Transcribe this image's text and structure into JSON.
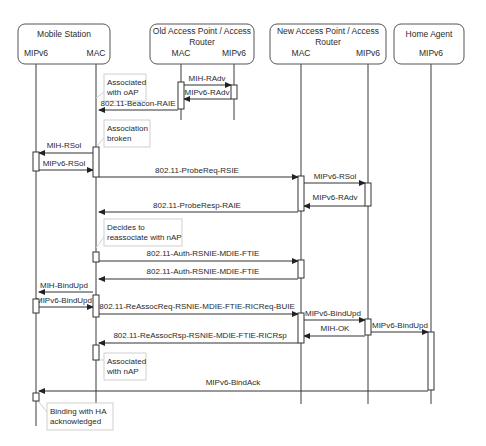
{
  "participants": [
    {
      "id": "ms",
      "title_lines": [
        "Mobile Station"
      ],
      "box": {
        "x": 18,
        "y": 24,
        "w": 92,
        "h": 40
      },
      "title_y": [
        37
      ],
      "sub": [
        {
          "label": "MIPv6",
          "x": 36
        },
        {
          "label": "MAC",
          "x": 96
        }
      ]
    },
    {
      "id": "oap",
      "title_lines": [
        "Old Access Point / Access",
        "Router"
      ],
      "box": {
        "x": 150,
        "y": 24,
        "w": 104,
        "h": 40
      },
      "title_y": [
        34,
        45
      ],
      "sub": [
        {
          "label": "MAC",
          "x": 181
        },
        {
          "label": "MIPv6",
          "x": 234
        }
      ]
    },
    {
      "id": "nap",
      "title_lines": [
        "New Access Point / Access",
        "Router"
      ],
      "box": {
        "x": 270,
        "y": 24,
        "w": 116,
        "h": 40
      },
      "title_y": [
        34,
        45
      ],
      "sub": [
        {
          "label": "MAC",
          "x": 301
        },
        {
          "label": "MIPv6",
          "x": 368
        }
      ]
    },
    {
      "id": "ha",
      "title_lines": [
        "Home Agent"
      ],
      "box": {
        "x": 394,
        "y": 24,
        "w": 70,
        "h": 40
      },
      "title_y": [
        37
      ],
      "sub": [
        {
          "label": "MIPv6",
          "x": 431
        }
      ]
    }
  ],
  "lifelines": [
    {
      "name": "ms-mipv6",
      "x": 36,
      "y1": 64,
      "y2": 426
    },
    {
      "name": "ms-mac",
      "x": 96,
      "y1": 64,
      "y2": 404
    },
    {
      "name": "oap-mac",
      "x": 181,
      "y1": 64,
      "y2": 120
    },
    {
      "name": "oap-mipv6",
      "x": 234,
      "y1": 64,
      "y2": 120
    },
    {
      "name": "nap-mac",
      "x": 301,
      "y1": 64,
      "y2": 404
    },
    {
      "name": "nap-mipv6",
      "x": 368,
      "y1": 64,
      "y2": 404
    },
    {
      "name": "ha-mipv6",
      "x": 431,
      "y1": 64,
      "y2": 404
    }
  ],
  "activations": [
    {
      "x": 178,
      "y": 82,
      "w": 6,
      "h": 27
    },
    {
      "x": 231,
      "y": 85,
      "w": 6,
      "h": 14
    },
    {
      "x": 33,
      "y": 152,
      "w": 6,
      "h": 19
    },
    {
      "x": 93,
      "y": 147,
      "w": 6,
      "h": 30
    },
    {
      "x": 298,
      "y": 176,
      "w": 6,
      "h": 35
    },
    {
      "x": 365,
      "y": 183,
      "w": 6,
      "h": 23
    },
    {
      "x": 93,
      "y": 252,
      "w": 6,
      "h": 10
    },
    {
      "x": 298,
      "y": 260,
      "w": 6,
      "h": 18
    },
    {
      "x": 33,
      "y": 299,
      "w": 6,
      "h": 14
    },
    {
      "x": 93,
      "y": 295,
      "w": 6,
      "h": 22
    },
    {
      "x": 298,
      "y": 313,
      "w": 6,
      "h": 30
    },
    {
      "x": 365,
      "y": 319,
      "w": 6,
      "h": 16
    },
    {
      "x": 428,
      "y": 332,
      "w": 6,
      "h": 58
    },
    {
      "x": 93,
      "y": 345,
      "w": 6,
      "h": 15
    },
    {
      "x": 33,
      "y": 393,
      "w": 6,
      "h": 8
    }
  ],
  "messages": [
    {
      "label": "MIH-RAdv",
      "x1": 184,
      "x2": 231,
      "y": 85,
      "label_x": 207,
      "label_y": 81
    },
    {
      "label": "MIPv6-RAdv",
      "x1": 231,
      "x2": 184,
      "y": 99,
      "label_x": 207,
      "label_y": 95
    },
    {
      "label": "802.11-Beacon-RAIE",
      "x1": 178,
      "x2": 99,
      "y": 110,
      "label_x": 138,
      "label_y": 106
    },
    {
      "label": "MIH-RSol",
      "x1": 93,
      "x2": 39,
      "y": 153,
      "label_x": 64,
      "label_y": 148
    },
    {
      "label": "MIPv6-RSol",
      "x1": 39,
      "x2": 93,
      "y": 170,
      "label_x": 64,
      "label_y": 166
    },
    {
      "label": "802.11-ProbeReq-RSIE",
      "x1": 99,
      "x2": 298,
      "y": 177,
      "label_x": 197,
      "label_y": 173
    },
    {
      "label": "MIPv6-RSol",
      "x1": 304,
      "x2": 365,
      "y": 183,
      "label_x": 335,
      "label_y": 179
    },
    {
      "label": "MIPv6-RAdv",
      "x1": 365,
      "x2": 304,
      "y": 206,
      "label_x": 335,
      "label_y": 200
    },
    {
      "label": "802.11-ProbeResp-RAIE",
      "x1": 298,
      "x2": 99,
      "y": 212,
      "label_x": 197,
      "label_y": 208
    },
    {
      "label": "802.11-Auth-RSNIE-MDIE-FTIE",
      "x1": 99,
      "x2": 298,
      "y": 261,
      "label_x": 203,
      "label_y": 256
    },
    {
      "label": "802.11-Auth-RSNIE-MDIE-FTIE",
      "x1": 298,
      "x2": 99,
      "y": 279,
      "label_x": 203,
      "label_y": 274
    },
    {
      "label": "MIH-BindUpd",
      "x1": 93,
      "x2": 39,
      "y": 292,
      "label_x": 64,
      "label_y": 288
    },
    {
      "label": "MIPv6-BindUpd",
      "x1": 39,
      "x2": 93,
      "y": 307,
      "label_x": 64,
      "label_y": 303
    },
    {
      "label": "802.11-ReAssocReq-RSNIE-MDIE-FTIE-RICReq-BUIE",
      "x1": 99,
      "x2": 298,
      "y": 314,
      "label_x": 197,
      "label_y": 309
    },
    {
      "label": "MIPv6-BindUpd",
      "x1": 304,
      "x2": 365,
      "y": 320,
      "label_x": 333,
      "label_y": 316
    },
    {
      "label": "MIH-OK",
      "x1": 365,
      "x2": 304,
      "y": 336,
      "label_x": 335,
      "label_y": 331
    },
    {
      "label": "MIPv6-BindUpd",
      "x1": 371,
      "x2": 428,
      "y": 332,
      "label_x": 400,
      "label_y": 328
    },
    {
      "label": "802.11-ReAssocRsp-RSNIE-MDIE-FTIE-RICRsp",
      "x1": 298,
      "x2": 99,
      "y": 343,
      "label_x": 200,
      "label_y": 338
    },
    {
      "label": "MIPv6-BindAck",
      "x1": 428,
      "x2": 39,
      "y": 391,
      "label_x": 233,
      "label_y": 385
    }
  ],
  "notes": [
    {
      "lines": [
        "Associated",
        "with oAP"
      ],
      "x": 104,
      "y": 74,
      "w": 42,
      "h": 27,
      "link": {
        "x1": 96,
        "y1": 98,
        "x2": 104,
        "y2": 92
      }
    },
    {
      "lines": [
        "Association",
        "broken"
      ],
      "x": 104,
      "y": 120,
      "w": 46,
      "h": 27,
      "link": {
        "x1": 96,
        "y1": 147,
        "x2": 104,
        "y2": 138
      }
    },
    {
      "lines": [
        "Decides to",
        "reassociate with nAP"
      ],
      "x": 104,
      "y": 219,
      "w": 78,
      "h": 27,
      "link": {
        "x1": 96,
        "y1": 248,
        "x2": 104,
        "y2": 237
      }
    },
    {
      "lines": [
        "Associated",
        "with nAP"
      ],
      "x": 104,
      "y": 353,
      "w": 42,
      "h": 27,
      "link": {
        "x1": 96,
        "y1": 360,
        "x2": 104,
        "y2": 360
      }
    },
    {
      "lines": [
        "Binding with HA",
        "acknowledged"
      ],
      "x": 47,
      "y": 403,
      "w": 66,
      "h": 27,
      "link": {
        "x1": 38,
        "y1": 401,
        "x2": 47,
        "y2": 412
      }
    }
  ],
  "style": {
    "line_color": "#333333",
    "note_border": "#cfcfcf",
    "box_border": "#555555",
    "background": "#ffffff"
  }
}
